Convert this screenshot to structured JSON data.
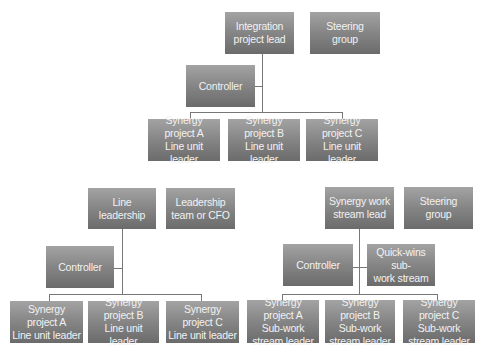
{
  "charts": [
    {
      "name": "integration-org",
      "lead": "Integration\nproject lead",
      "steering": "Steering group",
      "controller": "Controller",
      "projects": [
        "Synergy project A\nLine unit leader",
        "Synergy project B\nLine unit leader",
        "Synergy project C\nLine unit leader"
      ]
    },
    {
      "name": "line-leadership-org",
      "lead": "Line\nleadership",
      "steering": "Leadership\nteam or CFO",
      "controller": "Controller",
      "projects": [
        "Synergy project A\nLine unit leader",
        "Synergy project B\nLine unit leader",
        "Synergy project C\nLine unit leader"
      ]
    },
    {
      "name": "synergy-workstream-org",
      "lead": "Synergy work\nstream lead",
      "steering": "Steering\ngroup",
      "controller": "Controller",
      "quickwins": "Quick-wins sub-\nwork stream",
      "projects": [
        "Synergy project A\nSub-work\nstream leader",
        "Synergy project B\nSub-work\nstream leader",
        "Synergy project C\nSub-work\nstream leader"
      ]
    }
  ]
}
